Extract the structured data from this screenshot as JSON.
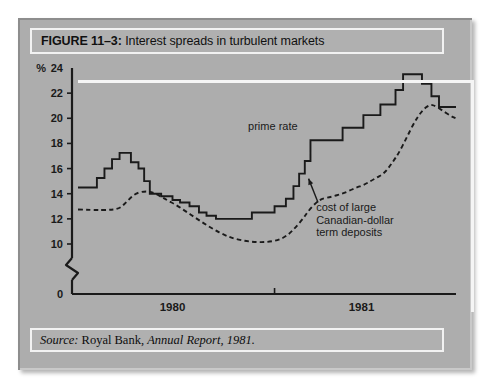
{
  "figure": {
    "number_label": "FIGURE 11–3:",
    "title": "Interest spreads in turbulent markets",
    "source_prefix": "Source:",
    "source_org": "Royal Bank,",
    "source_publication": "Annual Report, 1981."
  },
  "colors": {
    "panel_bg": "#adadad",
    "bevel_dark": "#8d8d8d",
    "bevel_light": "#c9c9c9",
    "inner_bar_bg": "#b0b0b0",
    "inner_bar_border": "#f2f2f2",
    "line": "#1a1a1a",
    "text": "#101010",
    "page_bg": "#ffffff"
  },
  "chart_data": {
    "type": "line",
    "title": "Interest spreads in turbulent markets",
    "subtitle": "",
    "xlabel": "",
    "ylabel": "%",
    "ylim": [
      10,
      24
    ],
    "y_axis_break": true,
    "y_break_between": [
      0,
      10
    ],
    "yticks": [
      0,
      10,
      12,
      14,
      16,
      18,
      20,
      22,
      24
    ],
    "ytick_labels": [
      "0",
      "10",
      "12",
      "14",
      "16",
      "18",
      "20",
      "22",
      "24"
    ],
    "xlim": [
      0,
      100
    ],
    "xticks": [
      25,
      75
    ],
    "xtick_labels": [
      "1980",
      "1981"
    ],
    "x_divider_at": 52,
    "grid": false,
    "legend_position": "inline-annotations",
    "annotations": [
      {
        "text": "prime rate",
        "x": 45,
        "y": 19.1,
        "target_series": "prime rate",
        "arrow": false
      },
      {
        "text": "cost of large\nCanadian-dollar\nterm deposits",
        "lines": [
          "cost of large",
          "Canadian-dollar",
          "term deposits"
        ],
        "x": 63,
        "y": 12.6,
        "target_series": "cost of large Canadian-dollar term deposits",
        "arrow": true,
        "arrow_from": [
          63.5,
          13.3
        ],
        "arrow_to": [
          61.0,
          15.2
        ]
      }
    ],
    "series": [
      {
        "name": "prime rate",
        "style": "step",
        "dash": "solid",
        "points": [
          [
            0.0,
            14.5
          ],
          [
            5.0,
            14.5
          ],
          [
            5.0,
            15.25
          ],
          [
            7.0,
            15.25
          ],
          [
            7.0,
            16.0
          ],
          [
            9.0,
            16.0
          ],
          [
            9.0,
            16.75
          ],
          [
            11.0,
            16.75
          ],
          [
            11.0,
            17.25
          ],
          [
            14.0,
            17.25
          ],
          [
            14.0,
            16.5
          ],
          [
            16.0,
            16.5
          ],
          [
            16.0,
            16.0
          ],
          [
            17.5,
            16.0
          ],
          [
            17.5,
            15.0
          ],
          [
            19.0,
            15.0
          ],
          [
            19.0,
            14.0
          ],
          [
            22.0,
            14.0
          ],
          [
            22.0,
            13.8
          ],
          [
            25.0,
            13.8
          ],
          [
            25.0,
            13.5
          ],
          [
            27.0,
            13.5
          ],
          [
            27.0,
            13.3
          ],
          [
            29.5,
            13.3
          ],
          [
            29.5,
            13.0
          ],
          [
            32.0,
            13.0
          ],
          [
            32.0,
            12.5
          ],
          [
            34.0,
            12.5
          ],
          [
            34.0,
            12.25
          ],
          [
            36.5,
            12.25
          ],
          [
            36.5,
            12.0
          ],
          [
            46.0,
            12.0
          ],
          [
            46.0,
            12.5
          ],
          [
            52.0,
            12.5
          ],
          [
            52.0,
            13.0
          ],
          [
            55.0,
            13.0
          ],
          [
            55.0,
            13.6
          ],
          [
            57.0,
            13.6
          ],
          [
            57.0,
            14.6
          ],
          [
            58.5,
            14.6
          ],
          [
            58.5,
            15.6
          ],
          [
            60.0,
            15.6
          ],
          [
            60.0,
            16.6
          ],
          [
            61.5,
            16.6
          ],
          [
            61.5,
            18.25
          ],
          [
            70.0,
            18.25
          ],
          [
            70.0,
            19.25
          ],
          [
            75.5,
            19.25
          ],
          [
            75.5,
            20.25
          ],
          [
            80.0,
            20.25
          ],
          [
            80.0,
            21.1
          ],
          [
            84.0,
            21.1
          ],
          [
            84.0,
            22.25
          ],
          [
            86.0,
            22.25
          ],
          [
            86.0,
            23.5
          ],
          [
            91.0,
            23.5
          ],
          [
            91.0,
            22.75
          ],
          [
            93.5,
            22.75
          ],
          [
            93.5,
            21.75
          ],
          [
            95.5,
            21.75
          ],
          [
            95.5,
            20.9
          ],
          [
            100.0,
            20.9
          ]
        ]
      },
      {
        "name": "cost of large Canadian-dollar term deposits",
        "style": "smooth",
        "dash": "dashed",
        "points": [
          [
            0.0,
            12.75
          ],
          [
            4.0,
            12.7
          ],
          [
            8.0,
            12.7
          ],
          [
            11.0,
            12.8
          ],
          [
            13.0,
            13.4
          ],
          [
            15.0,
            14.0
          ],
          [
            17.5,
            14.2
          ],
          [
            19.5,
            14.15
          ],
          [
            21.5,
            13.85
          ],
          [
            23.5,
            13.5
          ],
          [
            26.0,
            13.1
          ],
          [
            28.5,
            12.6
          ],
          [
            31.0,
            12.1
          ],
          [
            33.5,
            11.6
          ],
          [
            36.0,
            11.15
          ],
          [
            38.5,
            10.75
          ],
          [
            41.0,
            10.45
          ],
          [
            44.0,
            10.25
          ],
          [
            47.0,
            10.15
          ],
          [
            50.0,
            10.15
          ],
          [
            53.0,
            10.3
          ],
          [
            55.5,
            10.7
          ],
          [
            57.5,
            11.3
          ],
          [
            59.5,
            12.0
          ],
          [
            61.0,
            12.65
          ],
          [
            63.0,
            13.3
          ],
          [
            64.5,
            13.6
          ],
          [
            67.0,
            13.75
          ],
          [
            70.0,
            14.0
          ],
          [
            73.0,
            14.4
          ],
          [
            76.0,
            14.75
          ],
          [
            78.5,
            15.2
          ],
          [
            81.0,
            15.6
          ],
          [
            83.0,
            16.4
          ],
          [
            85.0,
            17.3
          ],
          [
            87.0,
            18.5
          ],
          [
            89.0,
            19.7
          ],
          [
            91.0,
            20.6
          ],
          [
            93.0,
            21.1
          ],
          [
            94.5,
            21.0
          ],
          [
            96.5,
            20.6
          ],
          [
            98.5,
            20.2
          ],
          [
            100.0,
            20.0
          ]
        ]
      }
    ]
  }
}
